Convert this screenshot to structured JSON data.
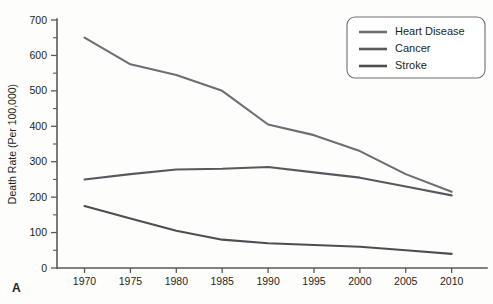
{
  "panel": {
    "label": "A"
  },
  "chart_data": {
    "type": "line",
    "title": "",
    "xlabel": "",
    "ylabel": "Death Rate (Per 100,000)",
    "x": [
      1970,
      1975,
      1980,
      1985,
      1990,
      1995,
      2000,
      2005,
      2010
    ],
    "categories": [
      "1970",
      "1975",
      "1980",
      "1985",
      "1990",
      "1995",
      "2000",
      "2005",
      "2010"
    ],
    "xlim": [
      1967,
      2012
    ],
    "ylim": [
      0,
      700
    ],
    "ytick_step": 100,
    "yminor_step": 50,
    "grid": false,
    "legend_position": "top-right",
    "yticks": [
      "0",
      "100",
      "200",
      "300",
      "400",
      "500",
      "600",
      "700"
    ],
    "series": [
      {
        "name": "Heart Disease",
        "color": "#6d6e71",
        "values": [
          650,
          575,
          545,
          500,
          405,
          375,
          330,
          265,
          215
        ]
      },
      {
        "name": "Cancer",
        "color": "#58595b",
        "values": [
          250,
          265,
          278,
          280,
          285,
          270,
          255,
          230,
          205
        ]
      },
      {
        "name": "Stroke",
        "color": "#4d4e50",
        "values": [
          175,
          140,
          105,
          80,
          70,
          65,
          60,
          50,
          40
        ]
      }
    ]
  },
  "legend": {
    "entries": [
      {
        "label": "Heart Disease"
      },
      {
        "label": "Cancer"
      },
      {
        "label": "Stroke"
      }
    ]
  }
}
